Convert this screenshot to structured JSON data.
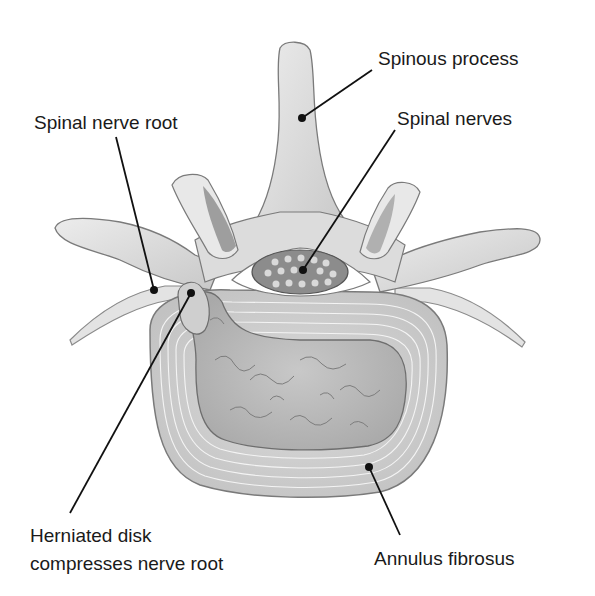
{
  "figure": {
    "type": "anatomical-diagram",
    "colors": {
      "background": "#ffffff",
      "bone_light": "#e6e6e6",
      "bone_mid": "#cfcfcf",
      "bone_dark": "#a8a8a8",
      "outline": "#7a7a7a",
      "nucleus": "#bdbdbd",
      "canal_fill": "#8c8c8c",
      "nerve_dots": "#d9d9d9",
      "leader_line": "#111111"
    }
  },
  "labels": {
    "spinous_process": "Spinous process",
    "spinal_nerve_root": "Spinal nerve root",
    "spinal_nerves": "Spinal nerves",
    "herniated_disk": "Herniated disk\ncompresses nerve root",
    "annulus_fibrosus": "Annulus fibrosus"
  }
}
